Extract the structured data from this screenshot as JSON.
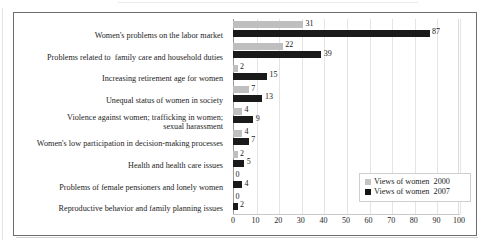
{
  "chart_data": {
    "type": "bar",
    "orientation": "horizontal",
    "title": "",
    "xlabel": "",
    "ylabel": "",
    "xlim": [
      0,
      100
    ],
    "xticks": [
      0,
      10,
      20,
      30,
      40,
      50,
      60,
      70,
      80,
      90,
      100
    ],
    "grid": true,
    "legend_position": "inside-bottom-right",
    "categories": [
      "Women's problems on the labor market",
      "Problems related to  family care and household duties",
      "Increasing retirement age for women",
      "Unequal status of women in society",
      "Violence against women; trafficking in women;\nsexual harassment",
      "Women's low participation in decision-making processes",
      "Health and health care issues",
      "Problems of female pensioners and lonely women",
      "Reproductive behavior and family planning issues"
    ],
    "series": [
      {
        "name": "Views of women  2000",
        "color": "#bfbfbf",
        "values": [
          31,
          22,
          2,
          7,
          4,
          4,
          2,
          0,
          0
        ]
      },
      {
        "name": "Views of women  2007",
        "color": "#1a1a1a",
        "values": [
          87,
          39,
          15,
          13,
          9,
          7,
          5,
          4,
          2
        ]
      }
    ]
  },
  "legend": {
    "items": [
      {
        "label": "Views of women  2000",
        "color": "#c4c4c4"
      },
      {
        "label": "Views of women  2007",
        "color": "#141414"
      }
    ]
  }
}
